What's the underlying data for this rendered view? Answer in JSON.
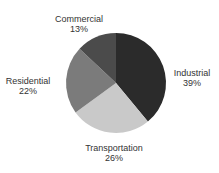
{
  "chart_data": {
    "type": "pie",
    "title": "",
    "start_angle_deg": 0,
    "direction": "clockwise",
    "center": [
      116,
      83
    ],
    "radius": 50,
    "categories": [
      "Industrial",
      "Transportation",
      "Residential",
      "Commercial"
    ],
    "values": [
      39,
      26,
      22,
      13
    ],
    "unit": "%",
    "colors": [
      "#2b2b2b",
      "#c9c9c9",
      "#7b7b7b",
      "#4b4b4b"
    ],
    "labels": [
      {
        "name": "Industrial",
        "pct": "39%",
        "x": 192,
        "y": 68
      },
      {
        "name": "Transportation",
        "pct": "26%",
        "x": 114,
        "y": 143
      },
      {
        "name": "Residential",
        "pct": "22%",
        "x": 28,
        "y": 76
      },
      {
        "name": "Commercial",
        "pct": "13%",
        "x": 79,
        "y": 14
      }
    ],
    "legend": "none"
  }
}
